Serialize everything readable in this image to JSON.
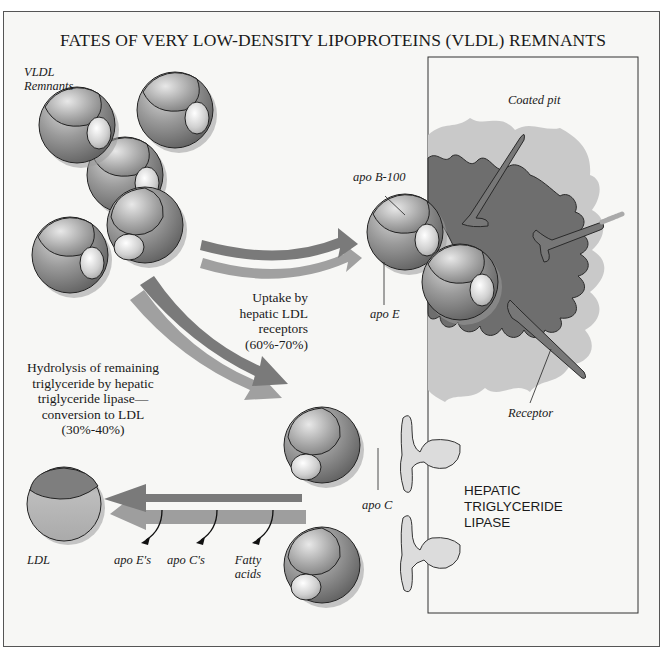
{
  "title": "FATES OF VERY LOW-DENSITY LIPOPROTEINS (VLDL) REMNANTS",
  "labels": {
    "vldl_remnants": "VLDL\nRemnants",
    "coated_pit": "Coated pit",
    "apo_b100": "apo B-100",
    "apo_e": "apo E",
    "receptor": "Receptor",
    "uptake": "Uptake by\nhepatic LDL\nreceptors\n(60%-70%)",
    "hydrolysis": "Hydrolysis of remaining\ntriglyceride by hepatic\ntriglyceride lipase—\nconversion to LDL\n(30%-40%)",
    "apo_c": "apo C",
    "hepatic_tg_lipase": "HEPATIC\nTRIGLYCERIDE\nLIPASE",
    "ldl": "LDL",
    "apo_es": "apo E's",
    "apo_cs": "apo C's",
    "fatty_acids": "Fatty\nacids"
  },
  "colors": {
    "background": "#f7f7f5",
    "frame": "#555555",
    "arrow_dark": "#7a7a7a",
    "arrow_light": "#9a9a9a",
    "pit_dark": "#6e6e6e",
    "pit_halo": "#c8c8c8",
    "lipase": "#dcdcdc"
  },
  "figure": {
    "elements": [
      {
        "id": "vldl-cluster",
        "kind": "particle-group",
        "count": 5
      },
      {
        "id": "uptake-arrow",
        "kind": "arrow",
        "direction": "right"
      },
      {
        "id": "hydrolysis-arrow",
        "kind": "arrow",
        "direction": "down-right"
      },
      {
        "id": "ldl-arrow",
        "kind": "arrow",
        "direction": "left"
      },
      {
        "id": "hepatocyte",
        "kind": "cell-rectangle"
      },
      {
        "id": "coated-pit",
        "kind": "membrane-invagination"
      },
      {
        "id": "lipase-1",
        "kind": "enzyme"
      },
      {
        "id": "lipase-2",
        "kind": "enzyme"
      },
      {
        "id": "ldl-particle",
        "kind": "particle"
      }
    ]
  }
}
